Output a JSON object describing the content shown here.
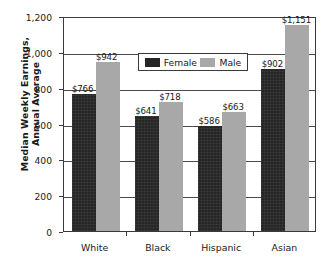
{
  "chart_data": {
    "type": "bar",
    "title": "",
    "subtitle": "",
    "xlabel": "",
    "ylabel": "Median Weekly Earnings, Annual Average",
    "ylabel_lines": [
      "Median Weekly Earnings,",
      "Annual Average"
    ],
    "categories": [
      "White",
      "Black",
      "Hispanic",
      "Asian"
    ],
    "series": [
      {
        "name": "Female",
        "color": "#262626",
        "values": [
          766,
          641,
          586,
          902
        ],
        "labels": [
          "$766",
          "$641",
          "$586",
          "$902"
        ]
      },
      {
        "name": "Male",
        "color": "#a8a8a8",
        "values": [
          942,
          718,
          663,
          1151
        ],
        "labels": [
          "$942",
          "$718",
          "$663",
          "$1,151"
        ]
      }
    ],
    "ylim": [
      0,
      1200
    ],
    "yticks": [
      0,
      200,
      400,
      600,
      800,
      1000,
      1200
    ],
    "ytick_labels": [
      "0",
      "200",
      "400",
      "600",
      "800",
      "1,000",
      "1,200"
    ],
    "grid": true,
    "grid_axis": "y",
    "legend_position": "top-center",
    "legend_entries": [
      "Female",
      "Male"
    ]
  },
  "legend": {
    "female_label": "Female",
    "male_label": "Male"
  },
  "axis": {
    "y_title_line1": "Median Weekly Earnings,",
    "y_title_line2": "Annual Average"
  }
}
